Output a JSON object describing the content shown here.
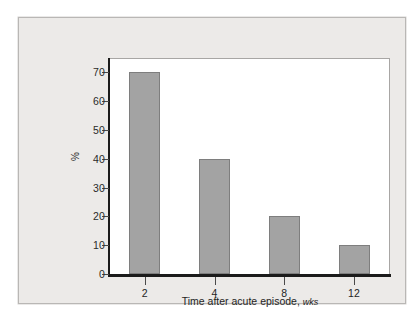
{
  "chart_data": {
    "type": "bar",
    "title": "",
    "xlabel": "Time after acute episode, wks",
    "xlabel_main": "Time after acute episode,",
    "xlabel_unit": "wks",
    "ylabel": "%",
    "categories": [
      "2",
      "4",
      "8",
      "12"
    ],
    "values": [
      70,
      40,
      20,
      10
    ],
    "ylim": [
      0,
      75
    ],
    "yticks": [
      0,
      10,
      20,
      30,
      40,
      50,
      60,
      70
    ],
    "ytick_labels": [
      "0",
      "10",
      "20",
      "30",
      "40",
      "50",
      "60",
      "70"
    ],
    "xtick_labels": [
      "2",
      "4",
      "8",
      "12"
    ],
    "grid": false,
    "legend": false,
    "bar_color": "#a3a3a3",
    "bar_edge_color": "#7e7e7e",
    "axis_color": "#1b1b1b",
    "plot_background": "#ffffff",
    "figure_background": "#eceae8"
  },
  "figure": {
    "caption": ""
  }
}
